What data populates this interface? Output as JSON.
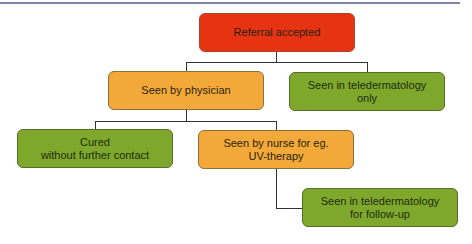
{
  "colors": {
    "red": "#e63412",
    "orange": "#f2a93a",
    "green": "#7ea82c",
    "connector": "#333333",
    "top_rule": "#7d83a6"
  },
  "nodes": {
    "referral": {
      "label": "Referral accepted",
      "color": "red"
    },
    "physician": {
      "label": "Seen by physician",
      "color": "orange"
    },
    "tele_only": {
      "label": "Seen in teledermatology\nonly",
      "color": "green"
    },
    "cured": {
      "label": "Cured\nwithout further contact",
      "color": "green"
    },
    "nurse": {
      "label": "Seen by nurse for eg.\nUV-therapy",
      "color": "orange"
    },
    "tele_followup": {
      "label": "Seen in teledermatology\nfor follow-up",
      "color": "green"
    }
  },
  "edges": [
    {
      "from": "referral",
      "to": "physician"
    },
    {
      "from": "referral",
      "to": "tele_only"
    },
    {
      "from": "physician",
      "to": "cured"
    },
    {
      "from": "physician",
      "to": "nurse"
    },
    {
      "from": "nurse",
      "to": "tele_followup"
    }
  ]
}
